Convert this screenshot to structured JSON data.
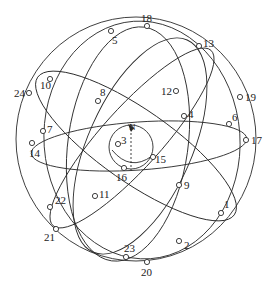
{
  "diagram": {
    "type": "sphere-with-great-circles",
    "colors": {
      "stroke": "#2a2a2a",
      "background": "#ffffff",
      "point_fill": "#ffffff"
    },
    "center_label": "N",
    "points": [
      {
        "id": "1",
        "label": "1",
        "x": 221,
        "y": 213,
        "lx": 224,
        "ly": 208
      },
      {
        "id": "2",
        "label": "2",
        "x": 179,
        "y": 241,
        "lx": 184,
        "ly": 249
      },
      {
        "id": "3",
        "label": "3",
        "x": 118,
        "y": 144,
        "lx": 121,
        "ly": 144
      },
      {
        "id": "4",
        "label": "4",
        "x": 184,
        "y": 116,
        "lx": 188,
        "ly": 118
      },
      {
        "id": "5",
        "label": "5",
        "x": 111,
        "y": 31,
        "lx": 112,
        "ly": 44
      },
      {
        "id": "6",
        "label": "6",
        "x": 229,
        "y": 124,
        "lx": 232,
        "ly": 121
      },
      {
        "id": "7",
        "label": "7",
        "x": 43,
        "y": 131,
        "lx": 47,
        "ly": 133
      },
      {
        "id": "8",
        "label": "8",
        "x": 98,
        "y": 101,
        "lx": 100,
        "ly": 96
      },
      {
        "id": "9",
        "label": "9",
        "x": 179,
        "y": 185,
        "lx": 184,
        "ly": 189
      },
      {
        "id": "10",
        "label": "10",
        "x": 50,
        "y": 79,
        "lx": 40,
        "ly": 89
      },
      {
        "id": "11",
        "label": "11",
        "x": 95,
        "y": 196,
        "lx": 99,
        "ly": 198
      },
      {
        "id": "12",
        "label": "12",
        "x": 176,
        "y": 91,
        "lx": 161,
        "ly": 95
      },
      {
        "id": "13",
        "label": "13",
        "x": 199,
        "y": 46,
        "lx": 203,
        "ly": 47
      },
      {
        "id": "14",
        "label": "14",
        "x": 32,
        "y": 143,
        "lx": 29,
        "ly": 157
      },
      {
        "id": "15",
        "label": "15",
        "x": 153,
        "y": 157,
        "lx": 155,
        "ly": 163
      },
      {
        "id": "16",
        "label": "16",
        "x": 124,
        "y": 168,
        "lx": 116,
        "ly": 181
      },
      {
        "id": "17",
        "label": "17",
        "x": 246,
        "y": 140,
        "lx": 251,
        "ly": 144
      },
      {
        "id": "18",
        "label": "18",
        "x": 147,
        "y": 26,
        "lx": 141,
        "ly": 22
      },
      {
        "id": "19",
        "label": "19",
        "x": 240,
        "y": 97,
        "lx": 245,
        "ly": 101
      },
      {
        "id": "20",
        "label": "20",
        "x": 147,
        "y": 262,
        "lx": 141,
        "ly": 276
      },
      {
        "id": "21",
        "label": "21",
        "x": 56,
        "y": 229,
        "lx": 44,
        "ly": 241
      },
      {
        "id": "22",
        "label": "22",
        "x": 50,
        "y": 207,
        "lx": 55,
        "ly": 204
      },
      {
        "id": "23",
        "label": "23",
        "x": 126,
        "y": 257,
        "lx": 124,
        "ly": 252
      },
      {
        "id": "24",
        "label": "24",
        "x": 29,
        "y": 93,
        "lx": 14,
        "ly": 97
      }
    ]
  }
}
